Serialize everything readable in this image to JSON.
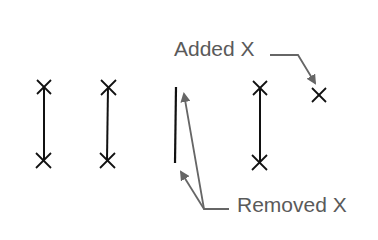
{
  "labels": {
    "added": "Added X",
    "removed": "Removed X"
  },
  "colors": {
    "marker": "#111111",
    "annotation": "#666666",
    "text": "#5a5a5a"
  },
  "diagram": {
    "connected_pairs": [
      {
        "x": 44,
        "top": 87,
        "bottom": 160
      },
      {
        "x": 108,
        "top": 87,
        "bottom": 160
      },
      {
        "x": 260,
        "top": 88,
        "bottom": 162
      }
    ],
    "removed_line": {
      "x": 176,
      "top": 87,
      "bottom": 163
    },
    "added_marker": {
      "x": 319,
      "y": 95
    }
  }
}
